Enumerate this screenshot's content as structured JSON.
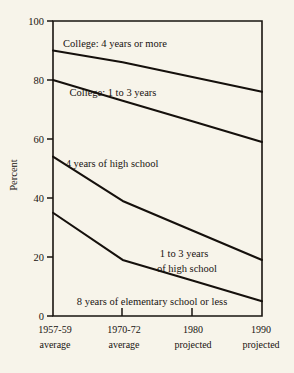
{
  "chart_data": {
    "type": "line",
    "title": "",
    "subtitle": "",
    "xlabel": "",
    "ylabel": "Percent",
    "ylim": [
      0,
      100
    ],
    "yticks": [
      0,
      20,
      40,
      60,
      80,
      100
    ],
    "ytick_labels": [
      "0",
      "20",
      "40",
      "60",
      "80",
      "100"
    ],
    "grid": false,
    "legend_position": "inline-annotations",
    "frame": "box",
    "x": [
      "1957-59 average",
      "1970-72 average",
      "1980 projected",
      "1990 projected"
    ],
    "xtick_labels": [
      {
        "line1": "1957-59",
        "line2": "average"
      },
      {
        "line1": "1970-72",
        "line2": "average"
      },
      {
        "line1": "1980",
        "line2": "projected"
      },
      {
        "line1": "1990",
        "line2": "projected"
      }
    ],
    "series": [
      {
        "name": "College: 4 years or more (lower boundary)",
        "values": [
          90,
          86,
          81,
          76
        ]
      },
      {
        "name": "College: 1 to 3 years (lower boundary)",
        "values": [
          80,
          73,
          66,
          59
        ]
      },
      {
        "name": "4 years of high school (lower boundary)",
        "values": [
          54,
          39,
          29,
          19
        ]
      },
      {
        "name": "1 to 3 years of high school (lower boundary)",
        "values": [
          35,
          19,
          12,
          5
        ]
      }
    ],
    "annotations": [
      {
        "id": "band-college-4plus",
        "text": "College: 4 years or more",
        "x": 1.55,
        "y": 94
      },
      {
        "id": "band-college-1to3",
        "text": "College: 1 to 3 years",
        "x": 1.5,
        "y": 83
      },
      {
        "id": "band-hs-4",
        "text": "4 years of high school",
        "x": 1.45,
        "y": 52
      },
      {
        "id": "band-hs-1to3-l1",
        "text": "1 to 3 years",
        "x": 2.3,
        "y": 25
      },
      {
        "id": "band-hs-1to3-l2",
        "text": "of high school",
        "x": 2.35,
        "y": 19
      },
      {
        "id": "band-elementary",
        "text": "8 years of elementary school or less",
        "x": 1.3,
        "y": 7
      }
    ],
    "colors": {
      "background": "#f7f4ea",
      "line": "#15100c",
      "axis": "#191410",
      "text": "#171310"
    }
  }
}
